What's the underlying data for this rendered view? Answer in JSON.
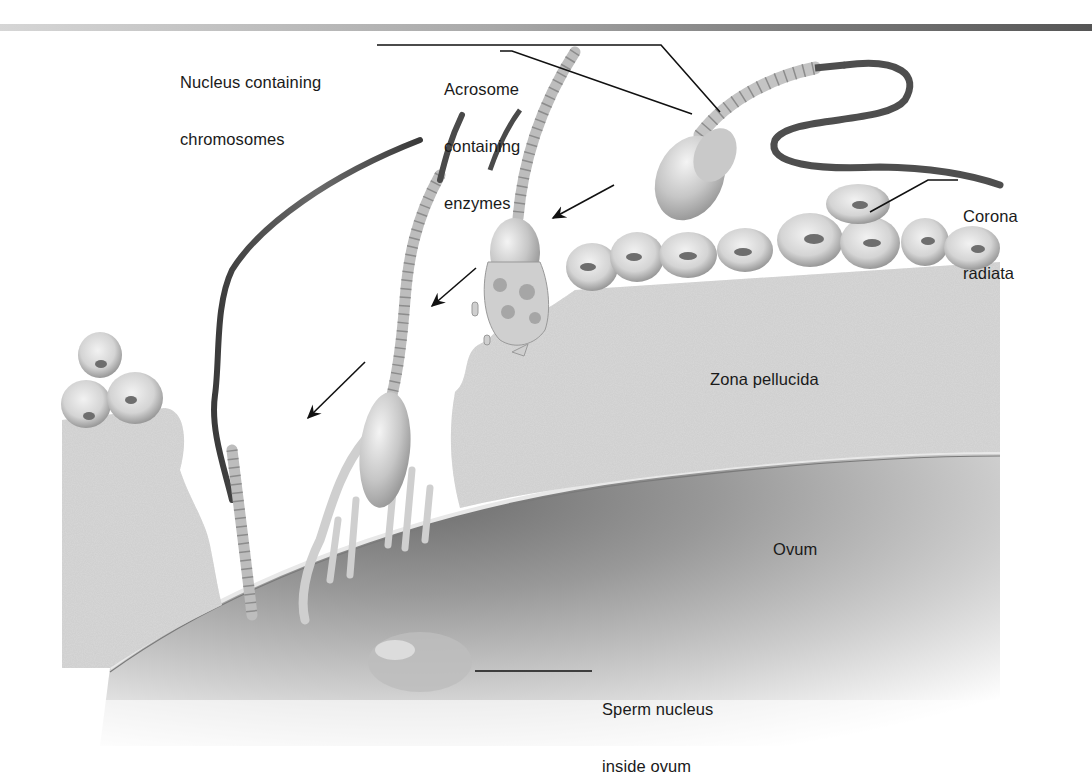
{
  "figure": {
    "header_bar": {
      "gradient_from": "#d6d6d6",
      "gradient_to": "#555555"
    }
  },
  "labels": {
    "nucleus": {
      "line1": "Nucleus containing",
      "line2": "chromosomes"
    },
    "acrosome": {
      "line1": "Acrosome",
      "line2": "containing",
      "line3": "enzymes"
    },
    "corona": {
      "line1": "Corona",
      "line2": "radiata"
    },
    "zona": {
      "text": "Zona pellucida"
    },
    "ovum": {
      "text": "Ovum"
    },
    "sperm_nucleus": {
      "line1": "Sperm nucleus",
      "line2": "inside ovum"
    }
  },
  "colors": {
    "label_text": "#1a1a1a",
    "leader_line": "#111111",
    "zona_fill": "#d9d9d9",
    "cell_fill": "#cfcfcf",
    "ovum_shadow": "#9a9a9a",
    "tail_dark": "#4a4a4a",
    "midpiece": "#c8c8c8"
  }
}
